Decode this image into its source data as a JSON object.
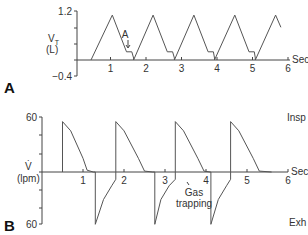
{
  "chart_data": [
    {
      "type": "line",
      "panel": "A",
      "title": "",
      "ylabel": "V_T (L)",
      "ylabel_main": "V",
      "ylabel_sub": "T",
      "ylabel_unit": "(L)",
      "xlabel": "Sec",
      "ylim": [
        -0.4,
        1.2
      ],
      "xlim": [
        0,
        6
      ],
      "y_ticks": [
        "1.2",
        "-0.4"
      ],
      "x_ticks": [
        "1",
        "2",
        "3",
        "4",
        "5",
        "6"
      ],
      "annotation": "A",
      "grid": false,
      "series": [
        {
          "name": "Tidal volume",
          "points_sec_L": [
            [
              0.45,
              0
            ],
            [
              1.05,
              1.1
            ],
            [
              1.45,
              0.2
            ],
            [
              1.6,
              0.2
            ],
            [
              1.65,
              0.05
            ],
            [
              1.65,
              0
            ],
            [
              2.2,
              1.1
            ],
            [
              2.6,
              0.2
            ],
            [
              2.75,
              0.2
            ],
            [
              2.8,
              0.05
            ],
            [
              2.8,
              0
            ],
            [
              3.35,
              1.1
            ],
            [
              3.75,
              0.2
            ],
            [
              3.9,
              0.2
            ],
            [
              3.93,
              0.05
            ],
            [
              3.93,
              0
            ],
            [
              4.5,
              1.1
            ],
            [
              4.9,
              0.2
            ],
            [
              5.05,
              0.2
            ],
            [
              5.08,
              0.05
            ],
            [
              5.08,
              0
            ],
            [
              5.65,
              1.1
            ],
            [
              5.8,
              0.8
            ]
          ]
        }
      ]
    },
    {
      "type": "line",
      "panel": "B",
      "title": "",
      "ylabel": "V̇ (lpm)",
      "ylabel_main": "V̇",
      "ylabel_unit": "(lpm)",
      "xlabel": "Sec",
      "ylim": [
        -60,
        60
      ],
      "xlim": [
        0,
        6
      ],
      "y_ticks": [
        "60",
        "60"
      ],
      "x_ticks": [
        "1",
        "2",
        "3",
        "4",
        "5",
        "6"
      ],
      "right_labels": [
        "Insp",
        "Exh"
      ],
      "annotation": "Gas trapping",
      "grid": false,
      "series": [
        {
          "name": "Flow",
          "points_sec_lpm": [
            [
              0.5,
              0
            ],
            [
              0.5,
              55
            ],
            [
              0.7,
              45
            ],
            [
              1.0,
              15
            ],
            [
              1.1,
              2
            ],
            [
              1.25,
              0
            ],
            [
              1.3,
              0
            ],
            [
              1.3,
              -57
            ],
            [
              1.5,
              -30
            ],
            [
              1.7,
              -15
            ],
            [
              1.8,
              -8
            ],
            [
              1.8,
              55
            ],
            [
              2.0,
              45
            ],
            [
              2.35,
              15
            ],
            [
              2.5,
              1
            ],
            [
              2.7,
              0
            ],
            [
              2.75,
              0
            ],
            [
              2.75,
              -57
            ],
            [
              2.9,
              -30
            ],
            [
              3.1,
              -15
            ],
            [
              3.25,
              -8
            ],
            [
              3.25,
              55
            ],
            [
              3.45,
              45
            ],
            [
              3.8,
              15
            ],
            [
              3.95,
              1
            ],
            [
              4.1,
              0
            ],
            [
              4.12,
              0
            ],
            [
              4.12,
              -57
            ],
            [
              4.3,
              -30
            ],
            [
              4.5,
              -15
            ],
            [
              4.6,
              -8
            ],
            [
              4.6,
              55
            ],
            [
              4.8,
              45
            ],
            [
              5.15,
              15
            ],
            [
              5.3,
              1
            ],
            [
              5.6,
              0
            ]
          ]
        }
      ]
    }
  ],
  "labels": {
    "panel_a": "A",
    "panel_b": "B",
    "a_y_top": "1.2",
    "a_y_bottom": "−0.4",
    "a_y_main": "V",
    "a_y_sub": "T",
    "a_y_unit": "(L)",
    "a_x_unit": "Sec",
    "a_annotation": "A",
    "b_y_top": "60",
    "b_y_bottom": "60",
    "b_y_main": "V̇",
    "b_y_unit": "(lpm)",
    "b_x_unit": "Sec",
    "b_insp": "Insp",
    "b_exh": "Exh",
    "b_gas_1": "Gas",
    "b_gas_2": "trapping",
    "x_ticks": [
      "1",
      "2",
      "3",
      "4",
      "5",
      "6"
    ]
  },
  "colors": {
    "line": "#555555",
    "axis": "#444444",
    "text": "#333333"
  }
}
